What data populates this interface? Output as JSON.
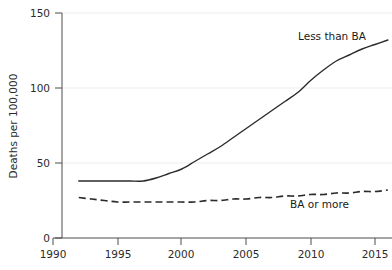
{
  "chart_data": {
    "type": "line",
    "title": "",
    "xlabel": "",
    "ylabel": "Deaths per 100,000",
    "xlim": [
      1990,
      2017
    ],
    "ylim": [
      0,
      150
    ],
    "grid": true,
    "legend_position": "inline-annotation",
    "xticks": [
      1990,
      1995,
      2000,
      2005,
      2010,
      2015
    ],
    "xtick_labels": [
      "1990",
      "1995",
      "2000",
      "2005",
      "2010",
      "2015"
    ],
    "yticks": [
      0,
      50,
      100,
      150
    ],
    "ytick_labels": [
      "0",
      "50",
      "100",
      "150"
    ],
    "x": [
      1992,
      1993,
      1994,
      1995,
      1996,
      1997,
      1998,
      1999,
      2000,
      2001,
      2002,
      2003,
      2004,
      2005,
      2006,
      2007,
      2008,
      2009,
      2010,
      2011,
      2012,
      2013,
      2014,
      2015,
      2016
    ],
    "series": [
      {
        "name": "Less than BA",
        "style": "solid",
        "annotation": "Less than BA",
        "values": [
          38,
          38,
          38,
          38,
          38,
          38,
          40,
          43,
          46,
          51,
          56,
          61,
          67,
          73,
          79,
          85,
          91,
          97,
          105,
          112,
          118,
          122,
          126,
          129,
          132
        ]
      },
      {
        "name": "BA or more",
        "style": "dashed",
        "annotation": "BA or more",
        "values": [
          27,
          26,
          25,
          24,
          24,
          24,
          24,
          24,
          24,
          24,
          25,
          25,
          26,
          26,
          27,
          27,
          28,
          28,
          29,
          29,
          30,
          30,
          31,
          31,
          32
        ]
      }
    ]
  },
  "axis": {
    "y_title": "Deaths per 100,000"
  },
  "annotations": {
    "series_1": "Less than BA",
    "series_2": "BA or more"
  },
  "colors": {
    "line": "#2b2b2b",
    "axis": "#4d4d4d",
    "grid": "#e8e8e8",
    "background": "#ffffff"
  }
}
